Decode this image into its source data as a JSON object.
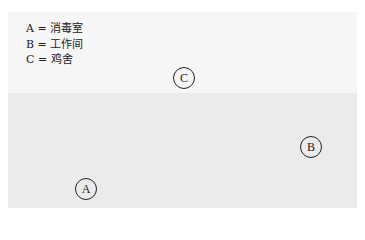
{
  "legend": {
    "items": [
      {
        "key": "A",
        "label": "A = 消毒室"
      },
      {
        "key": "B",
        "label": "B = 工作间"
      },
      {
        "key": "C",
        "label": "C = 鸡舍"
      }
    ]
  },
  "markers": {
    "a": "A",
    "b": "B",
    "c": "C"
  },
  "colors": {
    "upper_region": "#f6f6f6",
    "lower_region": "#ebebeb",
    "ink": "#222222"
  }
}
